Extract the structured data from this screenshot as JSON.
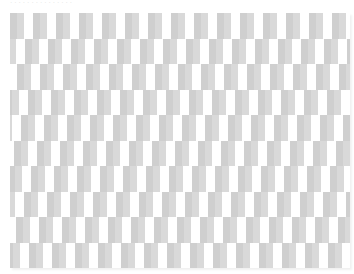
{
  "caption": {
    "text": "· · · · · · · · · · · · · · ·"
  },
  "pattern": {
    "description": "Offset gray/white rectangular tile pattern (illusion)",
    "colors": {
      "dark_gray": "#cfcfcf",
      "light_gray": "#d9d9d9",
      "white": "#ffffff"
    },
    "period_px": 23,
    "rows": [
      {
        "offset": 0
      },
      {
        "offset": -8
      },
      {
        "offset": -16
      },
      {
        "offset": -5
      },
      {
        "offset": -12
      },
      {
        "offset": -19
      },
      {
        "offset": -2
      },
      {
        "offset": -9
      },
      {
        "offset": -17
      },
      {
        "offset": -4
      }
    ]
  }
}
